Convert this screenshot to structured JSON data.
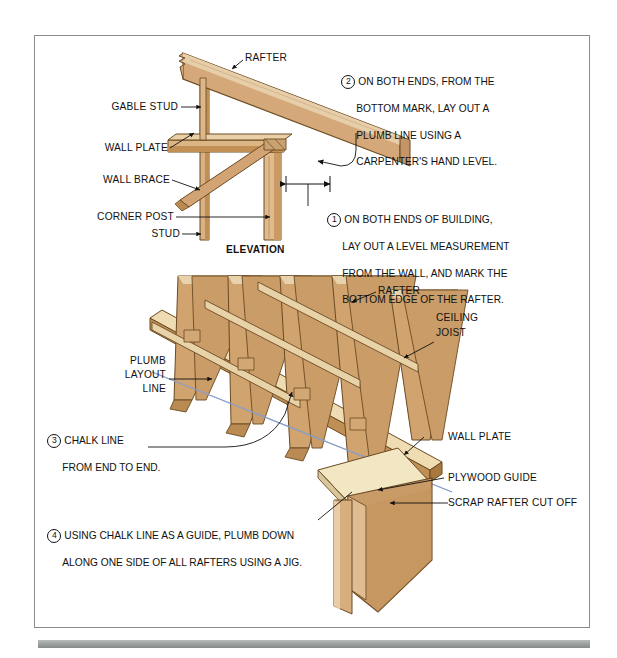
{
  "figure": {
    "title_caption": "ELEVATION",
    "upper_labels": [
      {
        "id": "rafter",
        "text": "RAFTER"
      },
      {
        "id": "gable-stud",
        "text": "GABLE STUD"
      },
      {
        "id": "wall-plate",
        "text": "WALL PLATE"
      },
      {
        "id": "wall-brace",
        "text": "WALL BRACE"
      },
      {
        "id": "corner-post",
        "text": "CORNER POST"
      },
      {
        "id": "stud",
        "text": "STUD"
      }
    ],
    "lower_labels": [
      {
        "id": "rafter2",
        "text": "RAFTER"
      },
      {
        "id": "ceiling-joist-1",
        "text": "CEILING"
      },
      {
        "id": "ceiling-joist-2",
        "text": "JOIST"
      },
      {
        "id": "plumb-1",
        "text": "PLUMB"
      },
      {
        "id": "plumb-2",
        "text": "LAYOUT"
      },
      {
        "id": "plumb-3",
        "text": "LINE"
      },
      {
        "id": "wall-plate-2",
        "text": "WALL PLATE"
      },
      {
        "id": "plywood-guide",
        "text": "PLYWOOD GUIDE"
      },
      {
        "id": "scrap-rafter",
        "text": "SCRAP RAFTER CUT OFF"
      }
    ],
    "steps": [
      {
        "number": "1",
        "lines": [
          "ON BOTH ENDS OF BUILDING,",
          "LAY OUT A LEVEL MEASUREMENT",
          "FROM THE WALL, AND MARK THE",
          "BOTTOM EDGE OF THE RAFTER."
        ]
      },
      {
        "number": "2",
        "lines": [
          "ON BOTH ENDS, FROM THE",
          "BOTTOM MARK, LAY OUT A",
          "PLUMB LINE USING A",
          "CARPENTER'S HAND LEVEL."
        ]
      },
      {
        "number": "3",
        "lines": [
          "CHALK LINE",
          "FROM END TO END."
        ]
      },
      {
        "number": "4",
        "lines": [
          "USING CHALK LINE AS A GUIDE, PLUMB DOWN",
          "ALONG ONE SIDE OF ALL RAFTERS USING A JIG."
        ]
      }
    ],
    "colors": {
      "wood_face": "#cfa171",
      "wood_light": "#e3c89d",
      "wood_pale": "#f0e4c0",
      "wood_dark": "#a9783f",
      "wood_edge": "#6b4a22",
      "chalk_line": "#7b93c4",
      "frame": "#8a8a8a",
      "rule": "#9aa09e",
      "text": "#111111"
    }
  }
}
